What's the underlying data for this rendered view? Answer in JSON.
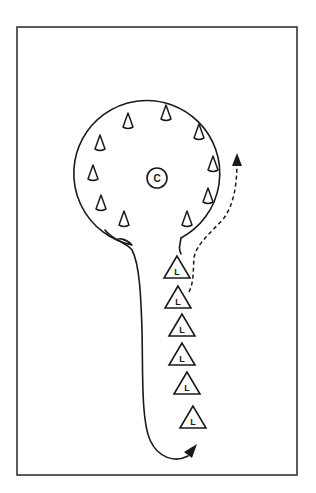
{
  "diagram": {
    "title": "",
    "type": "drill-layout",
    "colors": {
      "line": "#1a1a1a",
      "frame": "#333333",
      "background": "#ffffff"
    },
    "frame": {
      "x": 17,
      "y": 27,
      "width": 280,
      "height": 448
    },
    "center_marker": {
      "label": "C",
      "x": 157,
      "y": 178,
      "r": 10
    },
    "circle_area": {
      "cx": 158,
      "cy": 177,
      "r": 73
    },
    "circle_cones": [
      {
        "x": 128,
        "y": 123
      },
      {
        "x": 166,
        "y": 115
      },
      {
        "x": 199,
        "y": 134
      },
      {
        "x": 100,
        "y": 145
      },
      {
        "x": 213,
        "y": 166
      },
      {
        "x": 93,
        "y": 175
      },
      {
        "x": 208,
        "y": 198
      },
      {
        "x": 101,
        "y": 205
      },
      {
        "x": 124,
        "y": 221
      },
      {
        "x": 187,
        "y": 221
      }
    ],
    "line_cones": [
      {
        "label": "L",
        "x": 177,
        "y": 268
      },
      {
        "label": "L",
        "x": 178,
        "y": 298
      },
      {
        "label": "L",
        "x": 182,
        "y": 326
      },
      {
        "label": "L",
        "x": 182,
        "y": 355
      },
      {
        "label": "L",
        "x": 187,
        "y": 384
      },
      {
        "label": "L",
        "x": 193,
        "y": 418
      }
    ],
    "paths": {
      "boundary_label": "lollipop-shaped area",
      "solid_return_arrow": "curves from stem bottom toward last L cone",
      "dashed_run_arrow": "runs from L line up around the circle edge"
    }
  }
}
